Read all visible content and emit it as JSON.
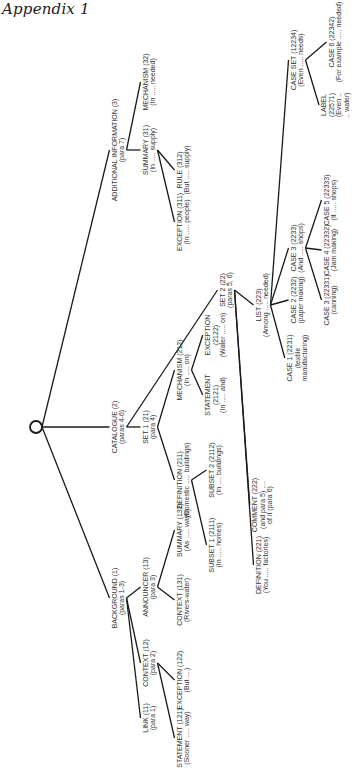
{
  "page": {
    "title": "Appendix 1"
  },
  "root": {
    "x": 36,
    "y": 427
  },
  "nodes": [
    {
      "id": "1",
      "x": 118,
      "y": 598,
      "lines": [
        "BACKGROUND (1)",
        "(paras 1-3)"
      ]
    },
    {
      "id": "11",
      "x": 149,
      "y": 718,
      "lines": [
        "LINK (11)",
        "(para 1)"
      ]
    },
    {
      "id": "12",
      "x": 149,
      "y": 663,
      "lines": [
        "CONTEXT (12)",
        "(para 2)"
      ]
    },
    {
      "id": "121",
      "x": 183,
      "y": 738,
      "lines": [
        "STATEMENT (121)",
        "(Sooner ..... way)"
      ]
    },
    {
      "id": "122",
      "x": 183,
      "y": 680,
      "lines": [
        "EXCEPTION (122)",
        "(But ....)"
      ]
    },
    {
      "id": "13",
      "x": 149,
      "y": 587,
      "lines": [
        "ANNOUNCER (13)",
        "(para 3)"
      ]
    },
    {
      "id": "131",
      "x": 183,
      "y": 600,
      "lines": [
        "CONTEXT (131)",
        "(Rivers-water)"
      ]
    },
    {
      "id": "132",
      "x": 183,
      "y": 530,
      "lines": [
        "SUMMARY (132)",
        "(As ..... ways)"
      ]
    },
    {
      "id": "2",
      "x": 118,
      "y": 427,
      "lines": [
        "CATALOGUE (2)",
        "(paras 4-6)"
      ]
    },
    {
      "id": "21",
      "x": 149,
      "y": 427,
      "lines": [
        "SET 1 (21)",
        "(para 4)"
      ]
    },
    {
      "id": "211",
      "x": 183,
      "y": 480,
      "lines": [
        "DEFINITION (211)",
        "(Domestic ..... buildings)"
      ]
    },
    {
      "id": "2111",
      "x": 215,
      "y": 545,
      "lines": [
        "SUBSET 1 (2111)",
        "(In ..... homes)"
      ]
    },
    {
      "id": "2112",
      "x": 215,
      "y": 470,
      "lines": [
        "SUBSET 2 (2112)",
        "(In .... buildings)"
      ]
    },
    {
      "id": "212",
      "x": 183,
      "y": 370,
      "lines": [
        "MECHANISM (212)",
        "(In ..... on)"
      ]
    },
    {
      "id": "2121",
      "x": 215,
      "y": 395,
      "lines": [
        "STATEMENT",
        "(2121)",
        "(In ..... and)"
      ]
    },
    {
      "id": "2122",
      "x": 215,
      "y": 335,
      "lines": [
        "EXCEPTION",
        "(2122)",
        "(Water ..... on)"
      ]
    },
    {
      "id": "22",
      "x": 226,
      "y": 290,
      "lines": [
        "SET 2 (22)",
        "(paras 5, 6)"
      ]
    },
    {
      "id": "221",
      "x": 262,
      "y": 565,
      "lines": [
        "DEFINITION (221)",
        "(You ..... factories)"
      ]
    },
    {
      "id": "222",
      "x": 262,
      "y": 505,
      "lines": [
        "COMMENT (222)",
        "(and para 5) ....",
        "of it (para 6)"
      ]
    },
    {
      "id": "223",
      "x": 262,
      "y": 305,
      "lines": [
        "LIST (223)",
        "(Among ..... needed)"
      ]
    },
    {
      "id": "2231",
      "x": 297,
      "y": 358,
      "lines": [
        "CASE 1 (2231)",
        "(textile",
        "manufacturing)"
      ]
    },
    {
      "id": "2232",
      "x": 297,
      "y": 300,
      "lines": [
        "CASE 2 (2232)",
        "(paper making)"
      ]
    },
    {
      "id": "2233",
      "x": 297,
      "y": 248,
      "lines": [
        "CASE 3 (2233)",
        "(And ..... shops)"
      ]
    },
    {
      "id": "22331",
      "x": 330,
      "y": 300,
      "lines": [
        "CASE 3 (22331)",
        "(canning)"
      ]
    },
    {
      "id": "22332",
      "x": 330,
      "y": 250,
      "lines": [
        "CASE 4 (22332)",
        "(Jam making)"
      ]
    },
    {
      "id": "22333",
      "x": 330,
      "y": 200,
      "lines": [
        "CASE 5 (22333)",
        "(It ..... shops)"
      ]
    },
    {
      "id": "2234",
      "x": 297,
      "y": 60,
      "lines": [
        "CASE SET (12234)",
        "(Even ..... needs)"
      ]
    },
    {
      "id": "22571",
      "x": 335,
      "y": 105,
      "lines": [
        "LABEL",
        "(22571)",
        "(Even ..",
        ".. water)"
      ]
    },
    {
      "id": "22342",
      "x": 335,
      "y": 42,
      "lines": [
        "CASE 6 (22342)",
        "(For example ..... needed)"
      ]
    },
    {
      "id": "3",
      "x": 118,
      "y": 150,
      "lines": [
        "ADDITIONAL INFORMATION (3)",
        "(para 7)"
      ]
    },
    {
      "id": "31",
      "x": 149,
      "y": 150,
      "lines": [
        "SUMMARY (31)",
        "(In ..... supply)"
      ]
    },
    {
      "id": "311",
      "x": 183,
      "y": 222,
      "lines": [
        "EXCEPTION (311)",
        "(In ..... people)"
      ]
    },
    {
      "id": "312",
      "x": 183,
      "y": 170,
      "lines": [
        "RULE (312)",
        "(But ..... supply)"
      ]
    },
    {
      "id": "32",
      "x": 149,
      "y": 82,
      "lines": [
        "MECHANISM (32)",
        "(In ..... needed)"
      ]
    }
  ],
  "edges": [
    [
      "root",
      "1"
    ],
    [
      "root",
      "2"
    ],
    [
      "root",
      "3"
    ],
    [
      "1",
      "11"
    ],
    [
      "1",
      "12"
    ],
    [
      "1",
      "13"
    ],
    [
      "12",
      "121"
    ],
    [
      "12",
      "122"
    ],
    [
      "13",
      "131"
    ],
    [
      "13",
      "132"
    ],
    [
      "2",
      "21"
    ],
    [
      "2",
      "22"
    ],
    [
      "21",
      "211"
    ],
    [
      "21",
      "212"
    ],
    [
      "211",
      "2111"
    ],
    [
      "211",
      "2112"
    ],
    [
      "212",
      "2121"
    ],
    [
      "212",
      "2122"
    ],
    [
      "22",
      "221"
    ],
    [
      "22",
      "222"
    ],
    [
      "22",
      "223"
    ],
    [
      "223",
      "2231"
    ],
    [
      "223",
      "2232"
    ],
    [
      "223",
      "2233"
    ],
    [
      "223",
      "2234"
    ],
    [
      "2233",
      "22331"
    ],
    [
      "2233",
      "22332"
    ],
    [
      "2233",
      "22333"
    ],
    [
      "2234",
      "22571"
    ],
    [
      "2234",
      "22342"
    ],
    [
      "3",
      "31"
    ],
    [
      "3",
      "32"
    ],
    [
      "31",
      "311"
    ],
    [
      "31",
      "312"
    ]
  ]
}
